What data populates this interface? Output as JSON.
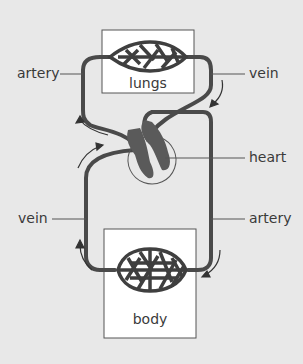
{
  "diagram": {
    "title": "",
    "type": "double circulation",
    "colors": {
      "background": "#e8e8e8",
      "vessel": "#4a4a4a",
      "heart": "#5a5a5a",
      "box_fill": "#ffffff",
      "text": "#3a3a3a"
    },
    "nodes": {
      "lungs": {
        "label": "lungs"
      },
      "body": {
        "label": "body"
      }
    },
    "labels": {
      "artery_top_left": "artery",
      "vein_top_right": "vein",
      "heart": "heart",
      "vein_bottom_left": "vein",
      "artery_bottom_right": "artery"
    }
  }
}
